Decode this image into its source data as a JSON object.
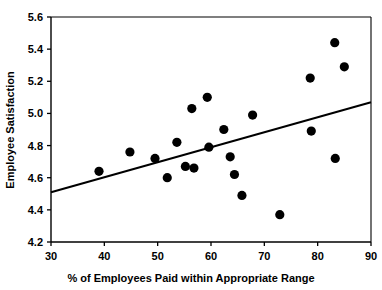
{
  "chart_data": {
    "type": "scatter",
    "title": "",
    "xlabel": "% of Employees Paid within Appropriate Range",
    "ylabel": "Employee Satisfaction",
    "xlim": [
      30,
      90
    ],
    "ylim": [
      4.2,
      5.6
    ],
    "xticks": [
      30,
      40,
      50,
      60,
      70,
      80,
      90
    ],
    "xtick_labels": [
      "30",
      "40",
      "50",
      "60",
      "70",
      "80",
      "90"
    ],
    "yticks": [
      4.2,
      4.4,
      4.6,
      4.8,
      5.0,
      5.2,
      5.4,
      5.6
    ],
    "ytick_labels": [
      "4.2",
      "4.4",
      "4.6",
      "4.8",
      "5.0",
      "5.2",
      "5.4",
      "5.6"
    ],
    "grid": false,
    "legend": null,
    "marker": "filled-circle",
    "marker_color": "#000000",
    "marker_size": 6,
    "points": [
      {
        "x": 39.0,
        "y": 4.64
      },
      {
        "x": 44.8,
        "y": 4.76
      },
      {
        "x": 49.5,
        "y": 4.72
      },
      {
        "x": 51.8,
        "y": 4.6
      },
      {
        "x": 53.6,
        "y": 4.82
      },
      {
        "x": 55.2,
        "y": 4.67
      },
      {
        "x": 56.4,
        "y": 5.03
      },
      {
        "x": 56.8,
        "y": 4.66
      },
      {
        "x": 59.3,
        "y": 5.1
      },
      {
        "x": 59.6,
        "y": 4.79
      },
      {
        "x": 62.4,
        "y": 4.9
      },
      {
        "x": 63.6,
        "y": 4.73
      },
      {
        "x": 64.4,
        "y": 4.62
      },
      {
        "x": 65.8,
        "y": 4.49
      },
      {
        "x": 67.8,
        "y": 4.99
      },
      {
        "x": 72.9,
        "y": 4.37
      },
      {
        "x": 78.6,
        "y": 5.22
      },
      {
        "x": 78.8,
        "y": 4.89
      },
      {
        "x": 83.2,
        "y": 5.44
      },
      {
        "x": 83.3,
        "y": 4.72
      },
      {
        "x": 85.0,
        "y": 5.29
      }
    ],
    "trendline": {
      "name": "linear-fit",
      "x_start": 30,
      "y_start": 4.51,
      "x_end": 90,
      "y_end": 5.07,
      "color": "#000000",
      "width": 2
    },
    "axis_color": "#000000",
    "background": "#ffffff"
  }
}
